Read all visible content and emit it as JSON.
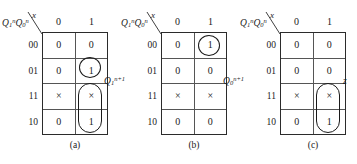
{
  "figure": {
    "col_var": "x",
    "row_var": {
      "text": "Q",
      "sub1": "1",
      "sup1": "n",
      "text2": "Q",
      "sub2": "0",
      "sup2": "n"
    },
    "col_headers": [
      "0",
      "1"
    ],
    "row_headers": [
      "00",
      "01",
      "11",
      "10"
    ],
    "maps": [
      {
        "caption": "(a)",
        "out_label": {
          "base": "Q",
          "sub": "1",
          "sup": "n+1"
        },
        "cells": [
          [
            "0",
            "0"
          ],
          [
            "0",
            "1"
          ],
          [
            "×",
            "×"
          ],
          [
            "0",
            "1"
          ]
        ],
        "groups": [
          {
            "name": "group-circle-row01-col1",
            "shape": "circle"
          },
          {
            "name": "group-oval-rows11-10-col1",
            "shape": "oval"
          }
        ]
      },
      {
        "caption": "(b)",
        "out_label": {
          "base": "Q",
          "sub": "0",
          "sup": "n+1"
        },
        "cells": [
          [
            "0",
            "1"
          ],
          [
            "0",
            "0"
          ],
          [
            "×",
            "×"
          ],
          [
            "0",
            "0"
          ]
        ],
        "groups": [
          {
            "name": "group-circle-row00-col1",
            "shape": "circle"
          }
        ]
      },
      {
        "caption": "(c)",
        "out_label": {
          "base": "z",
          "sub": "",
          "sup": ""
        },
        "cells": [
          [
            "0",
            "0"
          ],
          [
            "0",
            "0"
          ],
          [
            "×",
            "×"
          ],
          [
            "0",
            "1"
          ]
        ],
        "groups": [
          {
            "name": "group-oval-rows11-10-col1",
            "shape": "oval"
          }
        ]
      }
    ]
  }
}
